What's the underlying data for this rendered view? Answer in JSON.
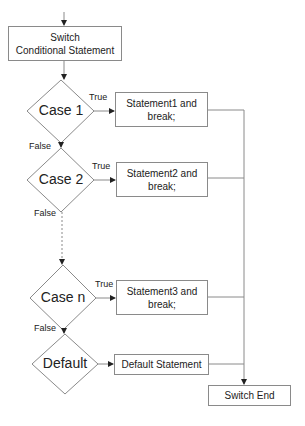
{
  "diagram": {
    "type": "flowchart",
    "start_box": {
      "line1": "Switch",
      "line2": "Conditional Statement"
    },
    "decisions": [
      {
        "label": "Case 1",
        "true_label": "True",
        "false_label": "False"
      },
      {
        "label": "Case 2",
        "true_label": "True",
        "false_label": "False"
      },
      {
        "label": "Case n",
        "true_label": "True",
        "false_label": "False"
      },
      {
        "label": "Default"
      }
    ],
    "statements": [
      {
        "line1": "Statement1 and",
        "line2": "break;"
      },
      {
        "line1": "Statement2 and",
        "line2": "break;"
      },
      {
        "line1": "Statement3 and",
        "line2": "break;"
      },
      {
        "line1": "Default Statement"
      }
    ],
    "end_box": {
      "label": "Switch End"
    },
    "colors": {
      "stroke": "#8a8a8a",
      "arrow": "#222222",
      "text": "#222222"
    }
  }
}
